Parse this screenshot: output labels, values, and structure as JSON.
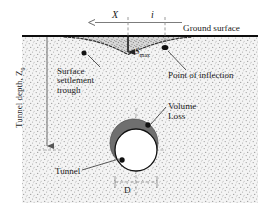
{
  "figure": {
    "type": "engineering-cross-section",
    "labels": {
      "ground_surface": "Ground surface",
      "x_axis": "X",
      "inflection_distance": "i",
      "max_settlement": "S",
      "max_settlement_sub": "max",
      "tunnel_depth": "Tunnel depth, Z",
      "tunnel_depth_sub": "0",
      "settlement_trough": "Surface\nsettlement\ntrough",
      "point_of_inflection": "Point of inflection",
      "volume_loss": "Volume\nLoss",
      "tunnel": "Tunnel",
      "diameter": "D"
    },
    "colors": {
      "soil_fill": "#f2f2f2",
      "soil_stipple": "#9a9a9a",
      "ground_line": "#111111",
      "trough_fill": "#c9c9c9",
      "volume_loss_ring": "#6e6e6e",
      "tunnel_fill": "#ffffff",
      "outline": "#1a1a1a",
      "leader": "#3a3a3a",
      "dash_gray": "#8c8c8c",
      "marker_dot": "#111111"
    },
    "geometry": {
      "ground_surface_y": 36,
      "soil_left": 22,
      "soil_right": 258,
      "soil_bottom": 203,
      "centerline_x": 128,
      "inflection_x": 165,
      "trough_left_x": 66,
      "trough_right_x": 190,
      "trough_min_y": 54,
      "tunnel_center_x": 136,
      "tunnel_center_y": 150,
      "tunnel_radius": 21,
      "volume_loss_center_x": 134,
      "volume_loss_center_y": 143,
      "volume_loss_radius": 24,
      "depth_arrow_x": 47,
      "depth_arrow_bottom_y": 150,
      "diameter_dim_y": 182
    },
    "markers": [
      {
        "name": "trough-left-point",
        "x": 84,
        "y": 53
      },
      {
        "name": "inflection-point-dot",
        "x": 165,
        "y": 48
      },
      {
        "name": "volume-loss-dot",
        "x": 148,
        "y": 125
      },
      {
        "name": "tunnel-dot",
        "x": 122,
        "y": 160
      }
    ]
  }
}
